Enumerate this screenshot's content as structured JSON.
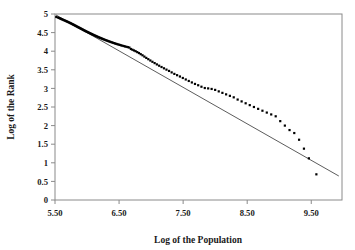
{
  "chart_data": {
    "type": "scatter",
    "title": "",
    "xlabel": "Log of the Population",
    "ylabel": "Log of the Rank",
    "xlim": [
      5.5,
      9.98
    ],
    "ylim": [
      0,
      5
    ],
    "xticks": [
      5.5,
      6.5,
      7.5,
      8.5,
      9.5
    ],
    "xticklabels": [
      "5.50",
      "6.50",
      "7.50",
      "8.50",
      "9.50"
    ],
    "yticks": [
      0,
      0.5,
      1,
      1.5,
      2,
      2.5,
      3,
      3.5,
      4,
      4.5,
      5
    ],
    "yticklabels": [
      "0",
      "0.5",
      "1",
      "1.5",
      "2",
      "2.5",
      "3",
      "3.5",
      "4",
      "4.5",
      "5"
    ],
    "grid": false,
    "legend": null,
    "marker": "square",
    "marker_color": "#000000",
    "series": [
      {
        "name": "rank-size observations",
        "x": [
          5.52,
          5.545,
          5.562,
          5.578,
          5.592,
          5.606,
          5.62,
          5.634,
          5.648,
          5.661,
          5.674,
          5.687,
          5.7,
          5.712,
          5.724,
          5.736,
          5.748,
          5.76,
          5.771,
          5.782,
          5.793,
          5.804,
          5.815,
          5.826,
          5.837,
          5.848,
          5.859,
          5.87,
          5.881,
          5.892,
          5.903,
          5.914,
          5.925,
          5.936,
          5.947,
          5.958,
          5.969,
          5.98,
          5.992,
          6.004,
          6.016,
          6.028,
          6.04,
          6.052,
          6.064,
          6.076,
          6.088,
          6.1,
          6.113,
          6.126,
          6.139,
          6.152,
          6.165,
          6.178,
          6.191,
          6.205,
          6.219,
          6.233,
          6.247,
          6.261,
          6.276,
          6.291,
          6.306,
          6.321,
          6.337,
          6.353,
          6.369,
          6.386,
          6.403,
          6.42,
          6.438,
          6.456,
          6.474,
          6.493,
          6.512,
          6.532,
          6.552,
          6.573,
          6.594,
          6.616,
          6.638,
          6.661,
          6.684,
          6.708,
          6.733,
          6.758,
          6.784,
          6.811,
          6.838,
          6.866,
          6.895,
          6.925,
          6.956,
          6.988,
          7.021,
          7.055,
          7.09,
          7.126,
          7.163,
          7.201,
          7.24,
          7.28,
          7.321,
          7.363,
          7.406,
          7.45,
          7.495,
          7.541,
          7.588,
          7.636,
          7.685,
          7.735,
          7.786,
          7.838,
          7.891,
          7.945,
          8.0,
          8.056,
          8.113,
          8.171,
          8.23,
          8.29,
          8.351,
          8.413,
          8.476,
          8.54,
          8.605,
          8.671,
          8.738,
          8.806,
          8.875,
          8.945,
          9.016,
          9.088,
          9.161,
          9.235,
          9.31,
          9.386,
          9.463,
          9.58
        ],
        "y": [
          4.92,
          4.905,
          4.893,
          4.881,
          4.87,
          4.859,
          4.848,
          4.838,
          4.828,
          4.818,
          4.808,
          4.798,
          4.788,
          4.778,
          4.768,
          4.758,
          4.748,
          4.738,
          4.728,
          4.718,
          4.708,
          4.698,
          4.688,
          4.678,
          4.668,
          4.658,
          4.648,
          4.638,
          4.628,
          4.618,
          4.608,
          4.598,
          4.588,
          4.578,
          4.568,
          4.558,
          4.548,
          4.538,
          4.528,
          4.518,
          4.508,
          4.498,
          4.488,
          4.478,
          4.468,
          4.458,
          4.448,
          4.438,
          4.428,
          4.418,
          4.408,
          4.398,
          4.388,
          4.378,
          4.368,
          4.358,
          4.348,
          4.338,
          4.328,
          4.318,
          4.308,
          4.298,
          4.288,
          4.278,
          4.268,
          4.258,
          4.248,
          4.238,
          4.228,
          4.218,
          4.208,
          4.198,
          4.188,
          4.178,
          4.168,
          4.158,
          4.148,
          4.138,
          4.128,
          4.118,
          4.108,
          4.098,
          4.06,
          4.04,
          4.02,
          4.0,
          3.975,
          3.95,
          3.92,
          3.89,
          3.855,
          3.82,
          3.785,
          3.75,
          3.715,
          3.68,
          3.645,
          3.61,
          3.575,
          3.54,
          3.505,
          3.47,
          3.43,
          3.39,
          3.355,
          3.32,
          3.28,
          3.24,
          3.2,
          3.16,
          3.12,
          3.085,
          3.045,
          3.01,
          3.0,
          2.985,
          2.96,
          2.92,
          2.88,
          2.84,
          2.8,
          2.76,
          2.7,
          2.65,
          2.6,
          2.55,
          2.5,
          2.45,
          2.4,
          2.35,
          2.3,
          2.25,
          2.12,
          2.0,
          1.88,
          1.8,
          1.62,
          1.38,
          1.12,
          0.69
        ]
      }
    ],
    "fit_line": {
      "name": "fitted regression line",
      "x_start": 5.515,
      "y_start": 4.975,
      "x_end": 9.93,
      "y_end": 0.645,
      "slope": -0.981,
      "intercept": 10.386,
      "color": "#4a4a4a"
    }
  }
}
